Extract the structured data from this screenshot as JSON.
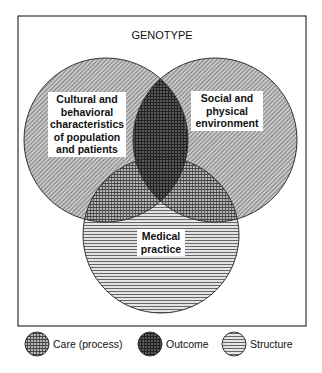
{
  "diagram": {
    "title": "GENOTYPE",
    "circles": [
      {
        "id": "left",
        "label_lines": [
          "Cultural and",
          "behavioral",
          "characteristics",
          "of population",
          "and patients"
        ],
        "pattern": "diagonal"
      },
      {
        "id": "right",
        "label_lines": [
          "Social and",
          "physical",
          "environment"
        ],
        "pattern": "diagonal"
      },
      {
        "id": "bottom",
        "label_lines": [
          "Medical",
          "practice"
        ],
        "pattern": "horizontal"
      }
    ],
    "legend": [
      {
        "label": "Care (process)",
        "pattern": "crosshatch-fine"
      },
      {
        "label": "Outcome",
        "pattern": "crosshatch-dark"
      },
      {
        "label": "Structure",
        "pattern": "horizontal"
      }
    ]
  }
}
